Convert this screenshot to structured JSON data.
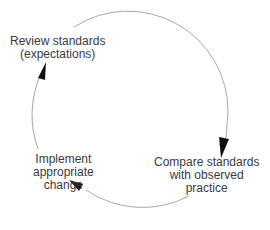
{
  "diagram": {
    "type": "cycle",
    "direction": "clockwise",
    "colors": {
      "arc": "#a8a8a8",
      "arrowhead": "#111111",
      "text": "#3a3a3a"
    },
    "nodes": [
      {
        "id": "review",
        "lines": [
          "Review standards",
          "(expectations)"
        ]
      },
      {
        "id": "compare",
        "lines": [
          "Compare standards",
          "with observed",
          "practice"
        ]
      },
      {
        "id": "implement",
        "lines": [
          "Implement",
          "appropriate",
          "change"
        ]
      }
    ],
    "edges": [
      {
        "from": "review",
        "to": "compare"
      },
      {
        "from": "compare",
        "to": "implement"
      },
      {
        "from": "implement",
        "to": "review"
      }
    ]
  }
}
